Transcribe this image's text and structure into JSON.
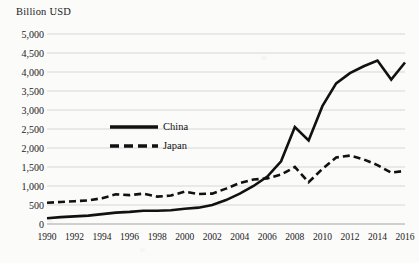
{
  "chart_data": {
    "type": "line",
    "title": "",
    "axis_unit_label": "Billion USD",
    "xlabel": "",
    "ylabel": "Billion USD",
    "grid": true,
    "legend_position": "inside-upper-left",
    "xlim": [
      1990,
      2016
    ],
    "ylim": [
      0,
      5000
    ],
    "ytick_labels": [
      "0",
      "500",
      "1,000",
      "1,500",
      "2,000",
      "2,500",
      "3,000",
      "3,500",
      "4,000",
      "4,500",
      "5,000"
    ],
    "ytick_values": [
      0,
      500,
      1000,
      1500,
      2000,
      2500,
      3000,
      3500,
      4000,
      4500,
      5000
    ],
    "xtick_labels": [
      "1990",
      "1992",
      "1994",
      "1996",
      "1998",
      "2000",
      "2002",
      "2004",
      "2006",
      "2008",
      "2010",
      "2012",
      "2014",
      "2016"
    ],
    "xtick_values": [
      1990,
      1992,
      1994,
      1996,
      1998,
      2000,
      2002,
      2004,
      2006,
      2008,
      2010,
      2012,
      2014,
      2016
    ],
    "x": [
      1990,
      1991,
      1992,
      1993,
      1994,
      1995,
      1996,
      1997,
      1998,
      1999,
      2000,
      2001,
      2002,
      2003,
      2004,
      2005,
      2006,
      2007,
      2008,
      2009,
      2010,
      2011,
      2012,
      2013,
      2014,
      2015,
      2016
    ],
    "series": [
      {
        "name": "China",
        "style": "solid",
        "color": "#111111",
        "values": [
          150,
          180,
          200,
          220,
          260,
          300,
          320,
          350,
          350,
          360,
          400,
          430,
          500,
          630,
          800,
          1000,
          1250,
          1650,
          2550,
          2200,
          3100,
          3700,
          3970,
          4150,
          4300,
          3800,
          4250
        ]
      },
      {
        "name": "Japan",
        "style": "dashed",
        "color": "#111111",
        "values": [
          560,
          580,
          600,
          620,
          680,
          780,
          760,
          800,
          720,
          750,
          850,
          790,
          800,
          930,
          1080,
          1170,
          1200,
          1300,
          1500,
          1100,
          1450,
          1750,
          1800,
          1700,
          1550,
          1350,
          1400
        ]
      }
    ]
  },
  "legend": {
    "items": [
      {
        "label": "China",
        "style": "solid"
      },
      {
        "label": "Japan",
        "style": "dashed"
      }
    ]
  }
}
